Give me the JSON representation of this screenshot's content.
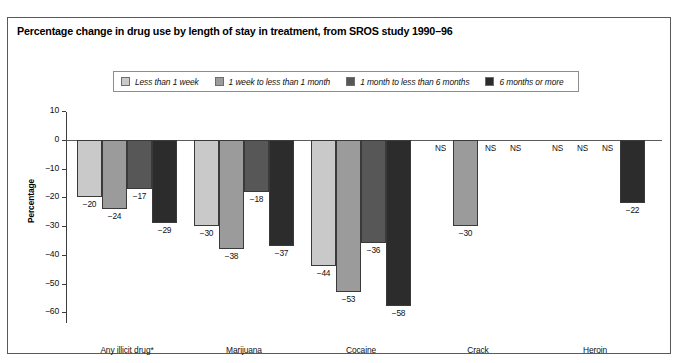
{
  "figure": {
    "title": "Percentage change in drug use by length of stay in treatment, from SROS study 1990–96"
  },
  "chart_data": {
    "type": "bar",
    "title": "Percentage change in drug use by length of stay in treatment, from SROS study 1990–96",
    "xlabel": "",
    "ylabel": "Percentage",
    "ylim": [
      -60,
      10
    ],
    "yticks": [
      10,
      0,
      -10,
      -20,
      -30,
      -40,
      -50,
      -60
    ],
    "ytick_labels": [
      "10",
      "0",
      "−10",
      "−20",
      "−30",
      "−40",
      "−50",
      "−60"
    ],
    "grid": false,
    "legend_position": "top",
    "categories": [
      "Any illicit drug*",
      "Marijuana",
      "Cocaine",
      "Crack",
      "Heroin"
    ],
    "series": [
      {
        "name": "Less than 1 week",
        "color": "#c9c9c9",
        "values": [
          -20,
          -30,
          -44,
          null,
          null
        ],
        "labels": [
          "−20",
          "−30",
          "−44",
          "NS",
          "NS"
        ]
      },
      {
        "name": "1 week to less than 1 month",
        "color": "#9b9b9b",
        "values": [
          -24,
          -38,
          -53,
          -30,
          null
        ],
        "labels": [
          "−24",
          "−38",
          "−53",
          "−30",
          "NS"
        ]
      },
      {
        "name": "1 month to less than 6 months",
        "color": "#575757",
        "values": [
          -17,
          -18,
          -36,
          null,
          null
        ],
        "labels": [
          "−17",
          "−18",
          "−36",
          "NS",
          "NS"
        ]
      },
      {
        "name": "6 months or more",
        "color": "#2c2c2c",
        "values": [
          -29,
          -37,
          -58,
          null,
          -22
        ],
        "labels": [
          "−29",
          "−37",
          "−58",
          "NS",
          "−22"
        ]
      }
    ],
    "not_significant_marker": "NS"
  }
}
